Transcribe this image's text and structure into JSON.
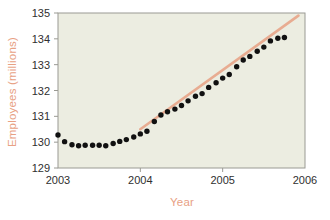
{
  "figure": {
    "background_color": "#ffffff",
    "plot_background_color": "#ecede1",
    "plot_border_color": "#9a9a93",
    "accent_color": "#e8a184",
    "point_color": "#111111",
    "tick_label_color": "#2f2f2f"
  },
  "chart_data": {
    "type": "scatter",
    "title": "",
    "xlabel": "Year",
    "ylabel": "Employees (millions)",
    "xlim": [
      2003,
      2006
    ],
    "ylim": [
      129,
      135
    ],
    "xticks": [
      2003,
      2004,
      2005,
      2006
    ],
    "xtick_labels": [
      "2003",
      "2004",
      "2005",
      "2006"
    ],
    "yticks": [
      129,
      130,
      131,
      132,
      133,
      134,
      135
    ],
    "ytick_labels": [
      "129",
      "130",
      "131",
      "132",
      "133",
      "134",
      "135"
    ],
    "grid": false,
    "legend": null,
    "x": [
      2003.0,
      2003.08,
      2003.17,
      2003.25,
      2003.33,
      2003.42,
      2003.5,
      2003.58,
      2003.67,
      2003.75,
      2003.83,
      2003.92,
      2004.0,
      2004.08,
      2004.17,
      2004.25,
      2004.33,
      2004.42,
      2004.5,
      2004.58,
      2004.67,
      2004.75,
      2004.83,
      2004.92,
      2005.0,
      2005.08,
      2005.17,
      2005.25,
      2005.33,
      2005.42,
      2005.5,
      2005.58,
      2005.67,
      2005.75
    ],
    "y": [
      130.28,
      130.02,
      129.9,
      129.86,
      129.88,
      129.88,
      129.88,
      129.86,
      129.95,
      130.03,
      130.1,
      130.2,
      130.32,
      130.42,
      130.8,
      131.05,
      131.18,
      131.28,
      131.42,
      131.6,
      131.78,
      131.88,
      132.12,
      132.3,
      132.48,
      132.62,
      132.92,
      133.18,
      133.32,
      133.52,
      133.68,
      133.92,
      134.02,
      134.05
    ],
    "values": [
      130.28,
      130.02,
      129.9,
      129.86,
      129.88,
      129.88,
      129.88,
      129.86,
      129.95,
      130.03,
      130.1,
      130.2,
      130.32,
      130.42,
      130.8,
      131.05,
      131.18,
      131.28,
      131.42,
      131.6,
      131.78,
      131.88,
      132.12,
      132.3,
      132.48,
      132.62,
      132.92,
      133.18,
      133.32,
      133.52,
      133.68,
      133.92,
      134.02,
      134.05
    ],
    "trend_line": {
      "label": "",
      "color": "#e8a184",
      "x_start": 2004.0,
      "y_start": 130.5,
      "x_end": 2005.92,
      "y_end": 134.9
    },
    "annotations": []
  }
}
